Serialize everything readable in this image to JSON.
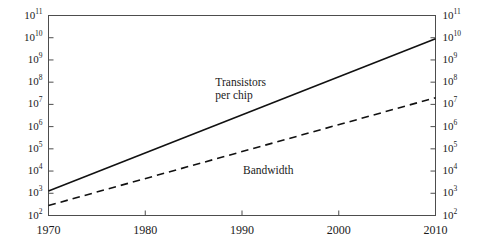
{
  "chart_data": {
    "type": "line",
    "title": "",
    "subtitle": "",
    "xlabel": "",
    "ylabel": "",
    "xlim": [
      1970,
      2010
    ],
    "ylim": [
      100,
      100000000000
    ],
    "yscale": "log",
    "xscale": "linear",
    "grid": false,
    "legend": "inline-annotations",
    "xticks": [
      1970,
      1980,
      1990,
      2000,
      2010
    ],
    "xticklabels": [
      "1970",
      "1980",
      "1990",
      "2000",
      "2010"
    ],
    "yticks": [
      100,
      1000,
      10000,
      100000,
      1000000,
      10000000,
      100000000,
      1000000000,
      10000000000,
      100000000000
    ],
    "yticklabels": [
      {
        "mantissa": "10",
        "exponent": "2"
      },
      {
        "mantissa": "10",
        "exponent": "3"
      },
      {
        "mantissa": "10",
        "exponent": "4"
      },
      {
        "mantissa": "10",
        "exponent": "5"
      },
      {
        "mantissa": "10",
        "exponent": "6"
      },
      {
        "mantissa": "10",
        "exponent": "7"
      },
      {
        "mantissa": "10",
        "exponent": "8"
      },
      {
        "mantissa": "10",
        "exponent": "9"
      },
      {
        "mantissa": "10",
        "exponent": "10"
      },
      {
        "mantissa": "10",
        "exponent": "11"
      }
    ],
    "right_axis_mirrors_left": true,
    "series": [
      {
        "name": "Transistors per chip",
        "label_line_1": "Transistors",
        "label_line_2": "per chip",
        "style": "solid",
        "color": "#111111",
        "x": [
          1970,
          2010
        ],
        "y_log10": [
          3.1,
          9.95
        ],
        "y": [
          1259,
          8912509381
        ],
        "annotation_x": 1992,
        "annotation_y_log10": 7.9
      },
      {
        "name": "Bandwidth",
        "label_line_1": "Bandwidth",
        "label_line_2": "",
        "style": "dashed",
        "color": "#111111",
        "x": [
          1970,
          2010
        ],
        "y_log10": [
          2.45,
          7.3
        ],
        "y": [
          282,
          19952623
        ],
        "annotation_x": 1993,
        "annotation_y_log10": 4.05
      }
    ]
  },
  "figure": {
    "background_color": "#ffffff",
    "frame_color": "#4d4d4d",
    "text_color": "#1a1a1a"
  }
}
